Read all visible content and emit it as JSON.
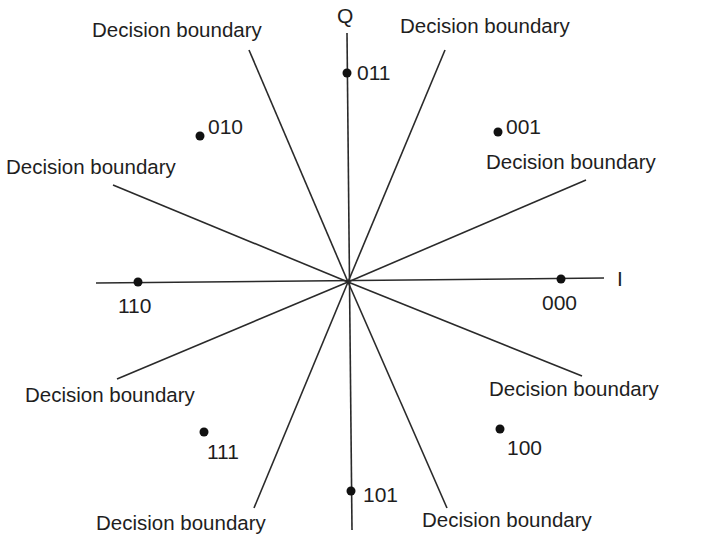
{
  "diagram": {
    "axes": {
      "i_label": "I",
      "q_label": "Q"
    },
    "boundary_label": "Decision boundary",
    "boundaries": [
      {
        "id": "b1",
        "label": "Decision boundary"
      },
      {
        "id": "b2",
        "label": "Decision boundary"
      },
      {
        "id": "b3",
        "label": "Decision boundary"
      },
      {
        "id": "b4",
        "label": "Decision boundary"
      },
      {
        "id": "b5",
        "label": "Decision boundary"
      },
      {
        "id": "b6",
        "label": "Decision boundary"
      },
      {
        "id": "b7",
        "label": "Decision boundary"
      },
      {
        "id": "b8",
        "label": "Decision boundary"
      }
    ],
    "symbols": [
      {
        "bits": "000",
        "angle_deg": 0
      },
      {
        "bits": "001",
        "angle_deg": 45
      },
      {
        "bits": "011",
        "angle_deg": 90
      },
      {
        "bits": "010",
        "angle_deg": 135
      },
      {
        "bits": "110",
        "angle_deg": 180
      },
      {
        "bits": "111",
        "angle_deg": 225
      },
      {
        "bits": "101",
        "angle_deg": 270
      },
      {
        "bits": "100",
        "angle_deg": 315
      }
    ],
    "colors": {
      "line": "#2a2a2a",
      "dot": "#111111",
      "text": "#1e1e1e",
      "background": "#ffffff"
    }
  }
}
